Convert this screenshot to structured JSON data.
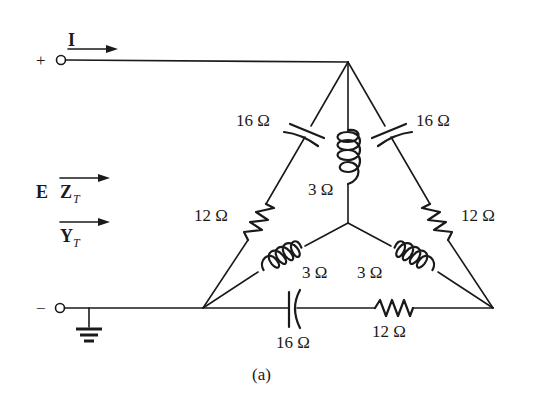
{
  "diagram": {
    "caption": "(a)",
    "terminals": {
      "positive": "+",
      "negative": "−"
    },
    "current_label": "I",
    "source_label": "E",
    "impedance_label": {
      "main": "Z",
      "sub": "T"
    },
    "admittance_label": {
      "main": "Y",
      "sub": "T"
    },
    "delta_branches": [
      {
        "id": "left",
        "components": [
          {
            "type": "capacitor",
            "label": "16 Ω"
          },
          {
            "type": "resistor",
            "label": "12 Ω"
          }
        ]
      },
      {
        "id": "right",
        "components": [
          {
            "type": "capacitor",
            "label": "16 Ω"
          },
          {
            "type": "resistor",
            "label": "12 Ω"
          }
        ]
      },
      {
        "id": "bottom",
        "components": [
          {
            "type": "capacitor",
            "label": "16 Ω"
          },
          {
            "type": "resistor",
            "label": "12 Ω"
          }
        ]
      }
    ],
    "wye_branches": [
      {
        "id": "top",
        "type": "inductor",
        "label": "3 Ω"
      },
      {
        "id": "left",
        "type": "inductor",
        "label": "3 Ω"
      },
      {
        "id": "right",
        "type": "inductor",
        "label": "3 Ω"
      }
    ],
    "labels": {
      "cap_left": "16 Ω",
      "cap_right": "16 Ω",
      "cap_bottom": "16 Ω",
      "res_left": "12 Ω",
      "res_right": "12 Ω",
      "res_bottom": "12 Ω",
      "ind_top": "3 Ω",
      "ind_left": "3 Ω",
      "ind_right": "3 Ω"
    },
    "ground": "ground-symbol"
  }
}
